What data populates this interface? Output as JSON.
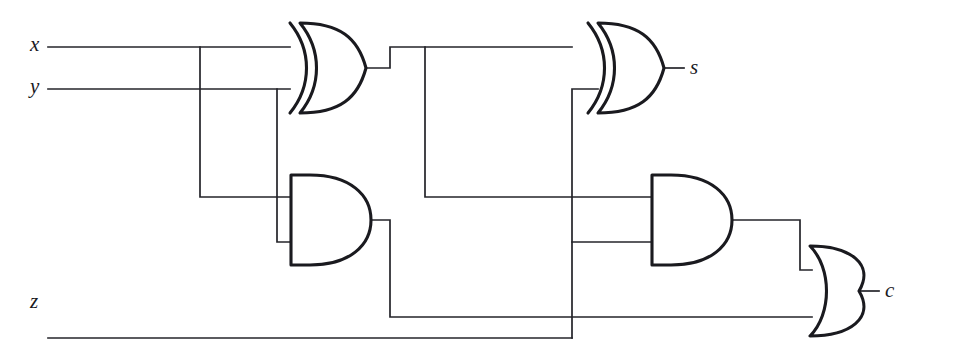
{
  "diagram": {
    "type": "logic-circuit",
    "background_color": "#ffffff",
    "wire_color": "#24242a",
    "gate_outline_color": "#1a1a1f"
  },
  "inputs": [
    {
      "id": "x",
      "label": "x",
      "x": 30,
      "y": 33
    },
    {
      "id": "y",
      "label": "y",
      "x": 30,
      "y": 76
    },
    {
      "id": "z",
      "label": "z",
      "x": 30,
      "y": 291
    }
  ],
  "outputs": [
    {
      "id": "s",
      "label": "s",
      "x": 690,
      "y": 57
    },
    {
      "id": "c",
      "label": "c",
      "x": 885,
      "y": 288
    }
  ],
  "gates": [
    {
      "id": "xor1",
      "type": "XOR",
      "name": "xor-gate-1",
      "inputs": [
        "x",
        "y"
      ],
      "output": "x_xor_y"
    },
    {
      "id": "xor2",
      "type": "XOR",
      "name": "xor-gate-2",
      "inputs": [
        "x_xor_y",
        "z"
      ],
      "output": "s"
    },
    {
      "id": "and1",
      "type": "AND",
      "name": "and-gate-1",
      "inputs": [
        "x",
        "y"
      ],
      "output": "x_and_y"
    },
    {
      "id": "and2",
      "type": "AND",
      "name": "and-gate-2",
      "inputs": [
        "x_xor_y",
        "z"
      ],
      "output": "xor_and_z"
    },
    {
      "id": "or1",
      "type": "OR",
      "name": "or-gate-1",
      "inputs": [
        "xor_and_z",
        "x_and_y"
      ],
      "output": "c"
    }
  ]
}
